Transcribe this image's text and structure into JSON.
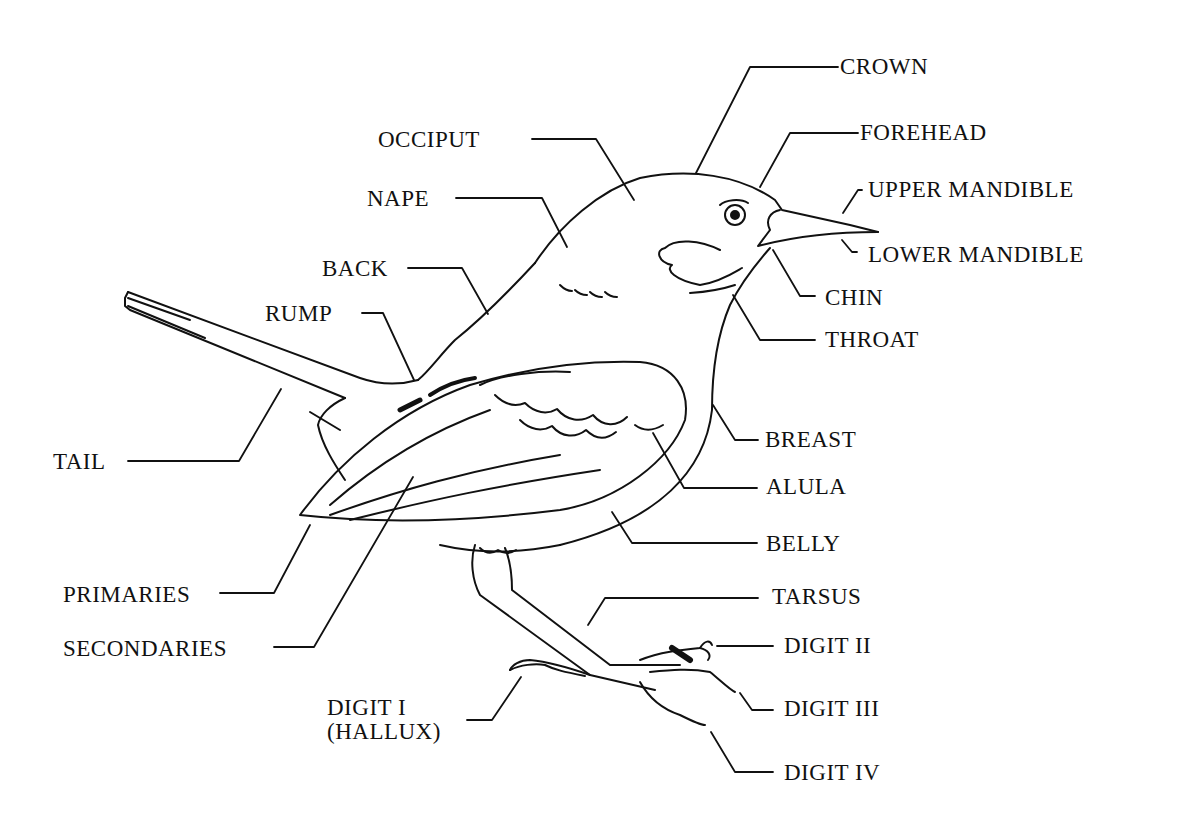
{
  "diagram": {
    "labels": {
      "crown": "CROWN",
      "forehead": "FOREHEAD",
      "upper_mandible": "UPPER MANDIBLE",
      "lower_mandible": "LOWER MANDIBLE",
      "chin": "CHIN",
      "throat": "THROAT",
      "occiput": "OCCIPUT",
      "nape": "NAPE",
      "back": "BACK",
      "rump": "RUMP",
      "tail": "TAIL",
      "breast": "BREAST",
      "alula": "ALULA",
      "belly": "BELLY",
      "primaries": "PRIMARIES",
      "secondaries": "SECONDARIES",
      "tarsus": "TARSUS",
      "digit_ii": "DIGIT II",
      "digit_iii": "DIGIT III",
      "digit_iv": "DIGIT IV",
      "digit_i_line1": "DIGIT I",
      "digit_i_line2": "(HALLUX)"
    },
    "colors": {
      "ink": "#111111",
      "background": "#ffffff"
    }
  }
}
